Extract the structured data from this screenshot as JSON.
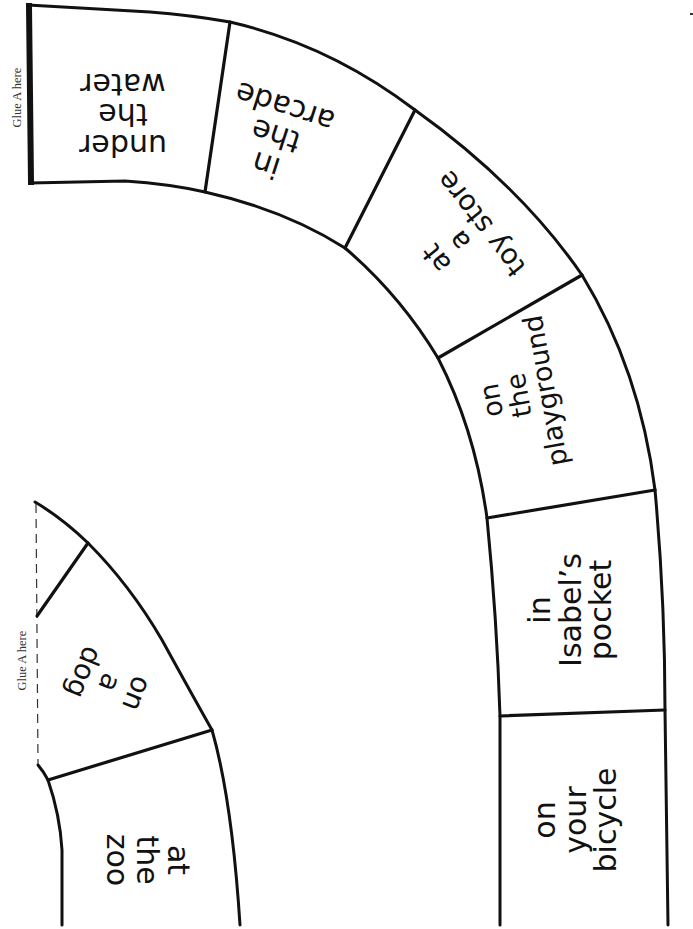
{
  "page": {
    "colors": {
      "ink": "#111111",
      "paper": "#ffffff",
      "glue_text": "#333333"
    }
  },
  "glue_labels": {
    "top_left": "Glue A here",
    "small_strip": "Glue A here"
  },
  "large_strip": {
    "cards": [
      {
        "id": "under-the-water",
        "text": "under\nthe\nwater"
      },
      {
        "id": "in-the-arcade",
        "text": "in\nthe\narcade"
      },
      {
        "id": "at-a-toy-store",
        "text": "at\na\ntoy store"
      },
      {
        "id": "on-the-playground",
        "text": "on\nthe\nplayground"
      },
      {
        "id": "in-isabels-pocket",
        "text": "in\nIsabel’s\npocket"
      },
      {
        "id": "on-your-bicycle",
        "text": "on\nyour\nbicycle"
      }
    ]
  },
  "small_strip": {
    "cards": [
      {
        "id": "on-a-dog",
        "text": "on\na\ndog"
      },
      {
        "id": "at-the-zoo",
        "text": "at\nthe\nzoo"
      }
    ]
  }
}
